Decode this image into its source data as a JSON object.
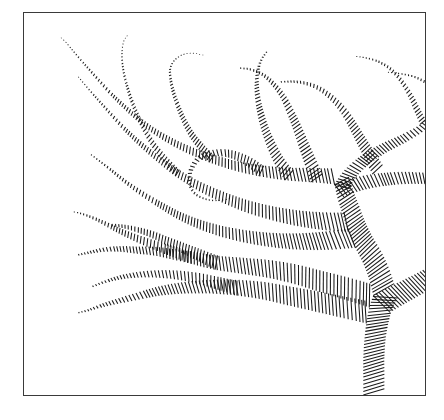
{
  "figure": {
    "title": "",
    "caption": "",
    "type": "glyph-streamline-plot",
    "background_color": "#ffffff",
    "frame": {
      "color": "#3a3a3a",
      "line_width": 1,
      "x": 23,
      "y": 12,
      "width": 403,
      "height": 384
    },
    "glyph": {
      "color": "#1a1a1a",
      "line_width": 1.05,
      "shape": "line-tick",
      "spacing_px": 3.0,
      "min_length_px": 0.6,
      "max_length_px": 46
    },
    "axes": {
      "visible": false,
      "ticks": false,
      "labels": false,
      "grid": false
    }
  },
  "chart_data": {
    "type": "line",
    "title": "",
    "xlabel": "",
    "ylabel": "",
    "xlim": [
      0,
      403
    ],
    "ylim": [
      0,
      384
    ],
    "grid": false,
    "legend": null,
    "series": [
      {
        "name": "trunk-base",
        "angle_offset": 0,
        "points": [
          [
            341,
            384
          ],
          [
            341,
            366
          ],
          [
            341,
            348
          ],
          [
            342,
            330
          ],
          [
            344,
            312
          ],
          [
            347,
            296
          ],
          [
            351,
            284
          ]
        ],
        "widths": [
          22,
          22,
          22,
          22,
          23,
          24,
          25
        ]
      },
      {
        "name": "trunk-upper",
        "angle_offset": 0,
        "points": [
          [
            351,
            284
          ],
          [
            347,
            268
          ],
          [
            341,
            252
          ],
          [
            333,
            236
          ],
          [
            326,
            220
          ],
          [
            320,
            202
          ],
          [
            315,
            186
          ],
          [
            312,
            172
          ]
        ],
        "widths": [
          24,
          23,
          22,
          21,
          20,
          19,
          18,
          16
        ]
      },
      {
        "name": "limb-right-lower",
        "angle_offset": 0,
        "points": [
          [
            351,
            284
          ],
          [
            366,
            276
          ],
          [
            382,
            268
          ],
          [
            398,
            260
          ],
          [
            412,
            252
          ],
          [
            426,
            245
          ]
        ],
        "widths": [
          24,
          23,
          22,
          21,
          20,
          19
        ]
      },
      {
        "name": "limb-right-mid",
        "angle_offset": 0,
        "points": [
          [
            312,
            172
          ],
          [
            330,
            166
          ],
          [
            350,
            162
          ],
          [
            372,
            160
          ],
          [
            392,
            160
          ],
          [
            410,
            162
          ],
          [
            422,
            168
          ],
          [
            426,
            176
          ]
        ],
        "widths": [
          16,
          15,
          14,
          13,
          12,
          11,
          10,
          9
        ]
      },
      {
        "name": "limb-right-upper-hook",
        "angle_offset": 0,
        "points": [
          [
            312,
            172
          ],
          [
            322,
            158
          ],
          [
            338,
            144
          ],
          [
            358,
            132
          ],
          [
            380,
            122
          ],
          [
            398,
            112
          ],
          [
            410,
            100
          ],
          [
            412,
            86
          ],
          [
            406,
            74
          ],
          [
            394,
            66
          ],
          [
            380,
            62
          ],
          [
            366,
            60
          ]
        ],
        "widths": [
          16,
          14,
          12,
          10.5,
          9,
          7.5,
          6,
          4.5,
          3.2,
          2.2,
          1.4,
          0.8
        ]
      },
      {
        "name": "branch-left-1",
        "angle_offset": 0,
        "points": [
          [
            312,
            172
          ],
          [
            288,
            170
          ],
          [
            262,
            168
          ],
          [
            236,
            164
          ],
          [
            210,
            158
          ],
          [
            186,
            150
          ],
          [
            162,
            140
          ],
          [
            140,
            128
          ],
          [
            120,
            114
          ],
          [
            102,
            98
          ],
          [
            86,
            82
          ],
          [
            72,
            66
          ],
          [
            60,
            52
          ],
          [
            50,
            40
          ],
          [
            42,
            30
          ],
          [
            36,
            24
          ]
        ],
        "widths": [
          16,
          14.5,
          13,
          11.5,
          10,
          8.8,
          7.6,
          6.4,
          5.4,
          4.4,
          3.5,
          2.7,
          2.0,
          1.4,
          0.9,
          0.5
        ]
      },
      {
        "name": "branch-left-2",
        "angle_offset": 0,
        "points": [
          [
            326,
            220
          ],
          [
            300,
            218
          ],
          [
            274,
            214
          ],
          [
            248,
            208
          ],
          [
            222,
            200
          ],
          [
            198,
            190
          ],
          [
            174,
            178
          ],
          [
            152,
            164
          ],
          [
            132,
            148
          ],
          [
            114,
            132
          ],
          [
            98,
            116
          ],
          [
            84,
            100
          ],
          [
            72,
            86
          ],
          [
            62,
            74
          ],
          [
            54,
            64
          ]
        ],
        "widths": [
          20,
          18,
          16,
          14.2,
          12.5,
          10.8,
          9.2,
          7.7,
          6.3,
          5.0,
          3.9,
          2.9,
          2.0,
          1.3,
          0.7
        ]
      },
      {
        "name": "branch-left-3",
        "angle_offset": 0,
        "points": [
          [
            333,
            236
          ],
          [
            306,
            238
          ],
          [
            280,
            238
          ],
          [
            254,
            236
          ],
          [
            228,
            232
          ],
          [
            202,
            226
          ],
          [
            178,
            218
          ],
          [
            156,
            208
          ],
          [
            136,
            196
          ],
          [
            118,
            184
          ],
          [
            102,
            172
          ],
          [
            88,
            160
          ],
          [
            76,
            150
          ],
          [
            66,
            142
          ]
        ],
        "widths": [
          21,
          19,
          17,
          15,
          13.2,
          11.4,
          9.7,
          8.0,
          6.5,
          5.1,
          3.9,
          2.8,
          1.8,
          1.0
        ]
      },
      {
        "name": "branch-left-4",
        "angle_offset": 0,
        "points": [
          [
            344,
            312
          ],
          [
            318,
            306
          ],
          [
            292,
            300
          ],
          [
            266,
            294
          ],
          [
            240,
            288
          ],
          [
            214,
            284
          ],
          [
            188,
            282
          ],
          [
            162,
            282
          ],
          [
            138,
            284
          ],
          [
            116,
            288
          ],
          [
            96,
            292
          ],
          [
            78,
            296
          ],
          [
            64,
            300
          ],
          [
            54,
            302
          ]
        ],
        "widths": [
          23,
          22,
          21,
          19.5,
          18,
          16,
          14,
          11.8,
          9.6,
          7.4,
          5.4,
          3.6,
          2.0,
          1.0
        ]
      },
      {
        "name": "branch-left-5",
        "angle_offset": 0,
        "points": [
          [
            347,
            296
          ],
          [
            322,
            288
          ],
          [
            296,
            280
          ],
          [
            270,
            272
          ],
          [
            244,
            266
          ],
          [
            218,
            262
          ],
          [
            192,
            258
          ],
          [
            168,
            252
          ],
          [
            146,
            244
          ],
          [
            126,
            236
          ],
          [
            108,
            228
          ],
          [
            92,
            220
          ],
          [
            78,
            212
          ],
          [
            66,
            206
          ],
          [
            56,
            202
          ],
          [
            48,
            200
          ]
        ],
        "widths": [
          24,
          23,
          21.5,
          20,
          18.2,
          16.4,
          14.5,
          12.6,
          10.7,
          8.8,
          7.0,
          5.4,
          3.9,
          2.6,
          1.5,
          0.7
        ]
      },
      {
        "name": "twig-mid-hook",
        "angle_offset": 0,
        "points": [
          [
            236,
            164
          ],
          [
            224,
            154
          ],
          [
            208,
            146
          ],
          [
            192,
            144
          ],
          [
            178,
            148
          ],
          [
            170,
            158
          ],
          [
            168,
            170
          ],
          [
            172,
            180
          ],
          [
            182,
            186
          ],
          [
            194,
            188
          ],
          [
            208,
            186
          ]
        ],
        "widths": [
          11.5,
          9.8,
          8.2,
          6.8,
          5.5,
          4.4,
          3.4,
          2.5,
          1.8,
          1.2,
          0.7
        ]
      },
      {
        "name": "twig-upper-left-a",
        "angle_offset": 0,
        "points": [
          [
            186,
            150
          ],
          [
            176,
            138
          ],
          [
            166,
            124
          ],
          [
            158,
            108
          ],
          [
            152,
            92
          ],
          [
            148,
            78
          ],
          [
            146,
            66
          ],
          [
            146,
            56
          ],
          [
            150,
            48
          ],
          [
            158,
            42
          ],
          [
            168,
            40
          ],
          [
            180,
            42
          ]
        ],
        "widths": [
          8.8,
          7.6,
          6.4,
          5.3,
          4.3,
          3.4,
          2.6,
          1.9,
          1.4,
          1.0,
          0.7,
          0.5
        ]
      },
      {
        "name": "twig-upper-left-b",
        "angle_offset": 0,
        "points": [
          [
            152,
            164
          ],
          [
            140,
            150
          ],
          [
            128,
            134
          ],
          [
            118,
            116
          ],
          [
            110,
            98
          ],
          [
            104,
            80
          ],
          [
            100,
            64
          ],
          [
            98,
            50
          ],
          [
            98,
            38
          ],
          [
            100,
            28
          ],
          [
            104,
            22
          ]
        ],
        "widths": [
          7.7,
          6.6,
          5.6,
          4.6,
          3.8,
          3.0,
          2.3,
          1.7,
          1.2,
          0.8,
          0.5
        ]
      },
      {
        "name": "twig-center-a",
        "angle_offset": 0,
        "points": [
          [
            262,
            168
          ],
          [
            252,
            152
          ],
          [
            244,
            134
          ],
          [
            238,
            116
          ],
          [
            234,
            98
          ],
          [
            232,
            82
          ],
          [
            232,
            68
          ],
          [
            234,
            56
          ],
          [
            238,
            46
          ],
          [
            244,
            38
          ]
        ],
        "widths": [
          13,
          11.2,
          9.5,
          7.9,
          6.4,
          5.1,
          3.9,
          2.9,
          2.0,
          1.2
        ]
      },
      {
        "name": "twig-center-b",
        "angle_offset": 0,
        "points": [
          [
            288,
            170
          ],
          [
            282,
            152
          ],
          [
            276,
            134
          ],
          [
            270,
            116
          ],
          [
            264,
            100
          ],
          [
            258,
            86
          ],
          [
            250,
            74
          ],
          [
            240,
            64
          ],
          [
            228,
            58
          ],
          [
            216,
            56
          ]
        ],
        "widths": [
          14.5,
          12.6,
          10.8,
          9.1,
          7.5,
          6.0,
          4.7,
          3.4,
          2.3,
          1.3
        ]
      },
      {
        "name": "twig-upper-right-a",
        "angle_offset": 0,
        "points": [
          [
            350,
            162
          ],
          [
            342,
            146
          ],
          [
            334,
            130
          ],
          [
            326,
            114
          ],
          [
            318,
            100
          ],
          [
            308,
            88
          ],
          [
            296,
            78
          ],
          [
            282,
            72
          ],
          [
            268,
            70
          ],
          [
            256,
            70
          ]
        ],
        "widths": [
          14,
          12.2,
          10.5,
          8.9,
          7.3,
          5.9,
          4.5,
          3.3,
          2.2,
          1.2
        ]
      },
      {
        "name": "twig-upper-right-b",
        "angle_offset": 0,
        "points": [
          [
            398,
            112
          ],
          [
            392,
            98
          ],
          [
            386,
            84
          ],
          [
            378,
            70
          ],
          [
            368,
            58
          ],
          [
            356,
            50
          ],
          [
            344,
            46
          ],
          [
            334,
            44
          ]
        ],
        "widths": [
          7.5,
          6.3,
          5.2,
          4.1,
          3.2,
          2.3,
          1.5,
          0.8
        ]
      },
      {
        "name": "twig-lower-left-fork",
        "angle_offset": 0,
        "points": [
          [
            214,
            284
          ],
          [
            194,
            278
          ],
          [
            174,
            272
          ],
          [
            154,
            268
          ],
          [
            134,
            266
          ],
          [
            114,
            266
          ],
          [
            96,
            268
          ],
          [
            80,
            272
          ],
          [
            68,
            276
          ]
        ],
        "widths": [
          15,
          13,
          11,
          9.2,
          7.4,
          5.7,
          4.1,
          2.6,
          1.3
        ]
      },
      {
        "name": "twig-lower-left-b",
        "angle_offset": 0,
        "points": [
          [
            168,
            252
          ],
          [
            150,
            248
          ],
          [
            132,
            244
          ],
          [
            114,
            242
          ],
          [
            96,
            240
          ],
          [
            80,
            240
          ],
          [
            66,
            242
          ],
          [
            54,
            244
          ]
        ],
        "widths": [
          12.6,
          10.8,
          9.0,
          7.3,
          5.7,
          4.2,
          2.7,
          1.4
        ]
      },
      {
        "name": "twig-mid-lower-a",
        "angle_offset": 0,
        "points": [
          [
            192,
            258
          ],
          [
            176,
            250
          ],
          [
            160,
            242
          ],
          [
            144,
            234
          ],
          [
            128,
            226
          ],
          [
            112,
            220
          ],
          [
            98,
            216
          ],
          [
            86,
            214
          ]
        ],
        "widths": [
          14.5,
          12.5,
          10.6,
          8.7,
          7.0,
          5.3,
          3.6,
          2.0
        ]
      }
    ]
  }
}
